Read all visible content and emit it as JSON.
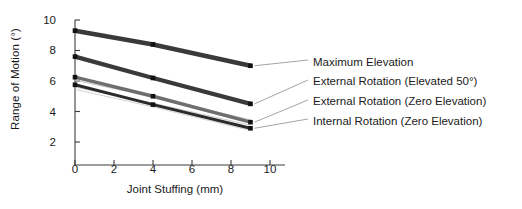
{
  "chart_data": {
    "type": "line",
    "title": "",
    "xlabel": "Joint Stuffing (mm)",
    "ylabel": "Range of Motion (°)",
    "xlim": [
      0,
      10
    ],
    "ylim": [
      0,
      10
    ],
    "xticks": [
      0,
      2,
      4,
      6,
      8,
      10
    ],
    "yticks": [
      2,
      4,
      6,
      8,
      10
    ],
    "grid": false,
    "legend_position": "right-outside",
    "marker": "square",
    "x": [
      0,
      4,
      9
    ],
    "series": [
      {
        "name": "Maximum Elevation",
        "values": [
          9.3,
          8.4,
          7.0
        ],
        "color": "#3a3a3a",
        "width": 4.6
      },
      {
        "name": "External Rotation (Elevated 50°)",
        "values": [
          7.6,
          6.2,
          4.5
        ],
        "color": "#3a3a3a",
        "width": 4.2
      },
      {
        "name": "External Rotation (Zero Elevation)",
        "values": [
          6.25,
          5.0,
          3.3
        ],
        "color": "#6e6e6e",
        "width": 3.4
      },
      {
        "name": "Internal Rotation (Zero Elevation)",
        "values": [
          5.75,
          4.45,
          2.9
        ],
        "color": "#2b2b2b",
        "width": 3.0
      }
    ],
    "thin_lines": [
      {
        "name": "thin-line-1",
        "values": [
          6.05,
          4.95,
          3.45
        ],
        "color": "#bdbdbd",
        "width": 0.9
      },
      {
        "name": "thin-line-2",
        "values": [
          5.6,
          4.55,
          3.1
        ],
        "color": "#c6c6c6",
        "width": 0.9
      },
      {
        "name": "thin-line-3",
        "values": [
          5.45,
          4.3,
          2.75
        ],
        "color": "#cccccc",
        "width": 0.9
      }
    ]
  },
  "legend": {
    "items": [
      {
        "label": "Maximum Elevation"
      },
      {
        "label": "External Rotation (Elevated 50°)"
      },
      {
        "label": "External Rotation (Zero Elevation)"
      },
      {
        "label": "Internal Rotation (Zero Elevation)"
      }
    ]
  },
  "axis": {
    "ytick_labels": [
      "10",
      "8",
      "6",
      "4",
      "2"
    ],
    "xtick_labels": [
      "0",
      "2",
      "4",
      "6",
      "8",
      "10"
    ]
  }
}
